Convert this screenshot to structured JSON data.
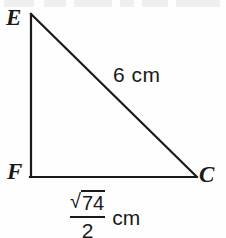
{
  "figure": {
    "kind": "right-triangle-diagram",
    "background_color": "#fefefe",
    "stroke_color": "#1a1a1a",
    "text_color": "#1a1a1a",
    "stroke_width": 2
  },
  "vertices": {
    "e": {
      "label": "E",
      "x": 31,
      "y": 14
    },
    "f": {
      "label": "F",
      "x": 31,
      "y": 177
    },
    "c": {
      "label": "C",
      "x": 196,
      "y": 177
    }
  },
  "measures": {
    "hypotenuse": {
      "side": "EC",
      "text": "6 cm",
      "value": "6",
      "unit": "cm"
    },
    "base": {
      "side": "FC",
      "radical_sign": "√",
      "radicand": "74",
      "denominator": "2",
      "unit": "cm"
    },
    "vertical_leg": {
      "side": "EF",
      "text": ""
    }
  }
}
